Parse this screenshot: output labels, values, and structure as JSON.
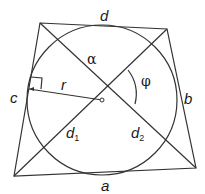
{
  "diagram": {
    "sides": {
      "top": "d",
      "right": "b",
      "bottom": "a",
      "left": "c"
    },
    "diagonals": {
      "first": "d",
      "first_sub": "1",
      "second": "d",
      "second_sub": "2"
    },
    "radius_label": "r",
    "angle_labels": {
      "alpha": "α",
      "phi": "φ"
    },
    "colors": {
      "stroke": "#333333",
      "text": "#1a1a1a",
      "background": "#ffffff"
    }
  }
}
